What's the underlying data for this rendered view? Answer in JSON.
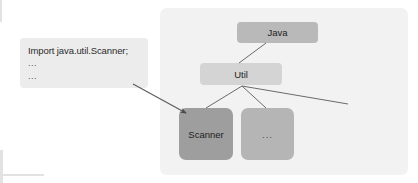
{
  "diagram": {
    "title_text": "",
    "code_box": {
      "lines": [
        "Import java.util.Scanner;",
        "...",
        "..."
      ]
    },
    "nodes": {
      "java": {
        "label": "Java",
        "color": "#b9b9b9"
      },
      "util": {
        "label": "Util",
        "color": "#d4d4d4"
      },
      "scanner": {
        "label": "Scanner",
        "color": "#9e9e9e"
      },
      "ellipsis": {
        "label": "...",
        "color": "#b5b5b5"
      }
    },
    "panel": {
      "color": "#f2f2f2"
    },
    "connectors": [
      {
        "name": "code-to-scanner",
        "from": "code-box",
        "to": "scanner",
        "arrow": true
      },
      {
        "name": "java-to-util",
        "from": "java",
        "to": "util",
        "arrow": false
      },
      {
        "name": "util-to-scanner",
        "from": "util",
        "to": "scanner",
        "arrow": false
      },
      {
        "name": "util-to-ellipsis",
        "from": "util",
        "to": "ellipsis",
        "arrow": false
      },
      {
        "name": "util-to-offscreen",
        "from": "util",
        "to": "right-edge",
        "arrow": false
      }
    ],
    "line_color": "#555555"
  }
}
